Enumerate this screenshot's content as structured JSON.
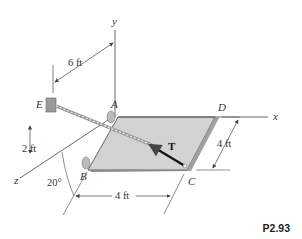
{
  "figure": {
    "problem_number": "P2.93",
    "points": {
      "A": "A",
      "B": "B",
      "C": "C",
      "D": "D",
      "E": "E"
    },
    "axes": {
      "x": "x",
      "y": "y",
      "z": "z"
    },
    "force_label": "T",
    "dimensions": {
      "ea_span": "6 ft",
      "e_height": "2 ft",
      "bc_length": "4 ft",
      "cd_length": "4 ft",
      "angle": "20°"
    },
    "colors": {
      "plate": "#cfcfcf",
      "plate_edge": "#555555",
      "line": "#444444",
      "cable": "#888888"
    }
  }
}
